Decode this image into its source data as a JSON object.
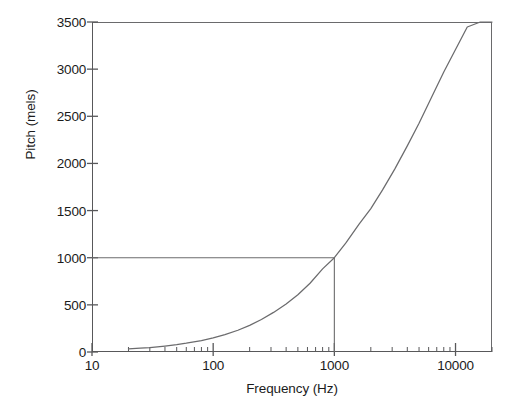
{
  "chart_data": {
    "type": "line",
    "title": "",
    "xlabel": "Frequency (Hz)",
    "ylabel": "Pitch (mels)",
    "xscale": "log",
    "yscale": "linear",
    "xlim": [
      10,
      20000
    ],
    "ylim": [
      0,
      3500
    ],
    "grid": false,
    "legend": null,
    "x_ticks": [
      {
        "value": 10,
        "label": "10"
      },
      {
        "value": 100,
        "label": "100"
      },
      {
        "value": 1000,
        "label": "1000"
      },
      {
        "value": 10000,
        "label": "10000"
      }
    ],
    "x_minor_ticks": [
      20,
      30,
      40,
      50,
      60,
      70,
      80,
      90,
      200,
      300,
      400,
      500,
      600,
      700,
      800,
      900,
      2000,
      3000,
      4000,
      5000,
      6000,
      7000,
      8000,
      9000,
      20000
    ],
    "y_ticks": [
      {
        "value": 0,
        "label": "0"
      },
      {
        "value": 500,
        "label": "500"
      },
      {
        "value": 1000,
        "label": "1000"
      },
      {
        "value": 1500,
        "label": "1500"
      },
      {
        "value": 2000,
        "label": "2000"
      },
      {
        "value": 2500,
        "label": "2500"
      },
      {
        "value": 3000,
        "label": "3000"
      },
      {
        "value": 3500,
        "label": "3500"
      }
    ],
    "series": [
      {
        "name": "Mel scale",
        "formula": "2595 * log10(1 + f / 700)",
        "x": [
          20,
          25,
          30,
          40,
          50,
          60,
          80,
          100,
          125,
          160,
          200,
          250,
          315,
          400,
          500,
          630,
          800,
          1000,
          1250,
          1600,
          2000,
          2500,
          3150,
          4000,
          5000,
          6300,
          8000,
          10000,
          12500,
          16000,
          20000
        ],
        "y": [
          32,
          40,
          47,
          63,
          78,
          93,
          121,
          150,
          184,
          231,
          283,
          345,
          420,
          509,
          607,
          729,
          882,
          1000,
          1159,
          1357,
          1521,
          1719,
          1940,
          2186,
          2427,
          2695,
          2969,
          3208,
          3447,
          3720,
          3964
        ]
      }
    ],
    "reference_lines": [
      {
        "name": "1000 Hz reference",
        "x": 1000,
        "y": 1000,
        "description": "Horizontal line at 1000 mels meeting vertical line at 1000 Hz on the curve"
      }
    ],
    "line_color": "#6b6b6d",
    "axis_color": "#58585a",
    "background_color": "#ffffff"
  }
}
